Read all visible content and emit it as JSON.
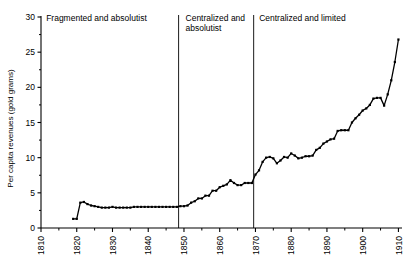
{
  "chart_data": {
    "type": "line",
    "title": "",
    "subtitle": "",
    "xlabel": "",
    "ylabel": "Per capita revenues (gold grams)",
    "xlim": [
      1810,
      1911
    ],
    "ylim": [
      0,
      30
    ],
    "grid": false,
    "legend": null,
    "y_ticks": [
      0,
      5,
      10,
      15,
      20,
      25,
      30
    ],
    "y_tick_labels": [
      "0",
      "5",
      "10",
      "15",
      "20",
      "25",
      "30"
    ],
    "y_minor_ticks": [
      2.5,
      7.5,
      12.5,
      17.5,
      22.5,
      27.5
    ],
    "x_ticks": [
      1810,
      1820,
      1830,
      1840,
      1850,
      1860,
      1870,
      1880,
      1890,
      1900,
      1910
    ],
    "x_tick_labels": [
      "1810",
      "1820",
      "1830",
      "1840",
      "1850",
      "1860",
      "1870",
      "1880",
      "1890",
      "1900",
      "1910"
    ],
    "x_minor_ticks": [
      1815,
      1825,
      1835,
      1845,
      1855,
      1865,
      1875,
      1885,
      1895,
      1905
    ],
    "x_tick_label_rotation": -90,
    "line_color": "#000000",
    "marker": "square",
    "marker_size": 2.2,
    "series": [
      {
        "name": "Per capita revenues",
        "x": [
          1819,
          1820,
          1821,
          1822,
          1823,
          1824,
          1825,
          1826,
          1827,
          1828,
          1829,
          1830,
          1831,
          1832,
          1833,
          1834,
          1835,
          1836,
          1837,
          1838,
          1839,
          1840,
          1841,
          1842,
          1843,
          1844,
          1845,
          1846,
          1847,
          1848,
          1849,
          1850,
          1851,
          1852,
          1853,
          1854,
          1855,
          1856,
          1857,
          1858,
          1859,
          1860,
          1861,
          1862,
          1863,
          1864,
          1865,
          1866,
          1867,
          1868,
          1869,
          1870,
          1871,
          1872,
          1873,
          1874,
          1875,
          1876,
          1877,
          1878,
          1879,
          1880,
          1881,
          1882,
          1883,
          1884,
          1885,
          1886,
          1887,
          1888,
          1889,
          1890,
          1891,
          1892,
          1893,
          1894,
          1895,
          1896,
          1897,
          1898,
          1899,
          1900,
          1901,
          1902,
          1903,
          1904,
          1905,
          1906,
          1907,
          1908,
          1909,
          1910
        ],
        "values": [
          1.3,
          1.3,
          3.6,
          3.7,
          3.4,
          3.2,
          3.1,
          3.0,
          2.9,
          2.9,
          2.9,
          3.0,
          2.9,
          2.9,
          2.9,
          2.9,
          2.9,
          3.0,
          3.0,
          3.0,
          3.0,
          3.0,
          3.0,
          3.0,
          3.0,
          3.0,
          3.0,
          3.0,
          3.0,
          3.0,
          3.1,
          3.1,
          3.2,
          3.6,
          3.8,
          4.2,
          4.2,
          4.6,
          4.6,
          5.3,
          5.3,
          5.8,
          6.0,
          6.2,
          6.8,
          6.4,
          6.1,
          6.1,
          6.4,
          6.4,
          6.4,
          7.6,
          8.2,
          9.4,
          10.0,
          10.1,
          9.9,
          9.2,
          9.6,
          10.1,
          10.0,
          10.6,
          10.3,
          9.9,
          10.0,
          10.2,
          10.2,
          10.3,
          11.1,
          11.4,
          12.0,
          12.3,
          12.6,
          12.7,
          13.8,
          13.9,
          13.9,
          13.9,
          15.0,
          15.6,
          16.1,
          16.7,
          17.0,
          17.5,
          18.4,
          18.5,
          18.5,
          17.4,
          19.0,
          21.0,
          23.6,
          26.8
        ]
      }
    ],
    "annotations": [
      {
        "id": "period-1",
        "text": "Fragmented and absolutist",
        "x": 1810.6,
        "lines": [
          "Fragmented and absolutist"
        ]
      },
      {
        "id": "period-2",
        "text": "Centralized and absolutist",
        "x": 1849.6,
        "lines": [
          "Centralized and",
          "absolutist"
        ]
      },
      {
        "id": "period-3",
        "text": "Centralized and limited",
        "x": 1870.2,
        "lines": [
          "Centralized and limited"
        ]
      }
    ],
    "vertical_dividers": [
      {
        "id": "divider-1848",
        "x": 1848.5
      },
      {
        "id": "divider-1869",
        "x": 1869.5
      }
    ]
  }
}
